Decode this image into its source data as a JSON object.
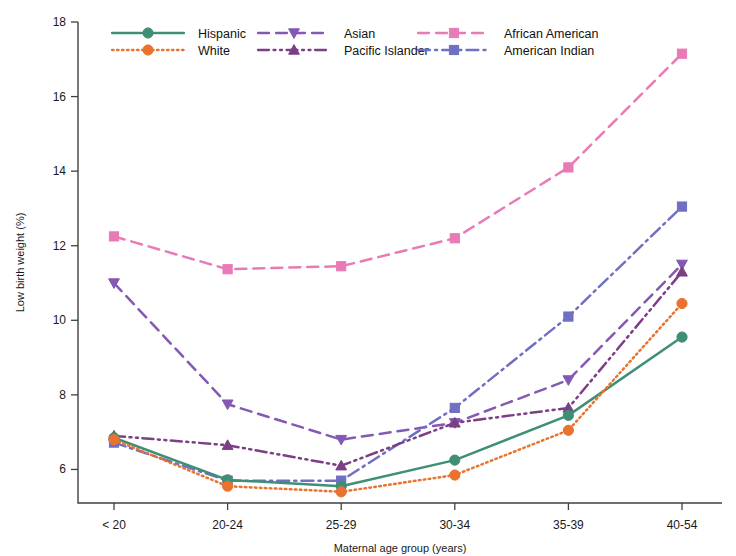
{
  "chart_data": {
    "type": "line",
    "title": "",
    "xlabel": "Maternal age group (years)",
    "ylabel": "Low birth weight (%)",
    "categories": [
      "< 20",
      "20-24",
      "25-29",
      "30-34",
      "35-39",
      "40-54"
    ],
    "ylim": [
      5.1,
      18.0
    ],
    "yticks": [
      6,
      8,
      10,
      12,
      14,
      16,
      18
    ],
    "ytick_labels": [
      "6",
      "8",
      "10",
      "12",
      "14",
      "16",
      "18"
    ],
    "grid": false,
    "legend_position": "top",
    "series": [
      {
        "name": "Hispanic",
        "color": "#3f8f77",
        "marker": "circle",
        "dash": "none",
        "values": [
          6.85,
          5.72,
          5.55,
          6.25,
          7.45,
          9.55
        ]
      },
      {
        "name": "White",
        "color": "#e8722e",
        "marker": "circle",
        "dash": "dotted",
        "values": [
          6.8,
          5.55,
          5.4,
          5.85,
          7.05,
          10.45
        ]
      },
      {
        "name": "Asian",
        "color": "#8359b3",
        "marker": "triangle-down",
        "dash": "dashed",
        "values": [
          11.0,
          7.75,
          6.8,
          7.25,
          8.4,
          11.5
        ]
      },
      {
        "name": "Pacific Islander",
        "color": "#7c3f86",
        "marker": "triangle-up",
        "dash": "dash-dot-dot",
        "values": [
          6.9,
          6.65,
          6.1,
          7.25,
          7.65,
          11.3
        ]
      },
      {
        "name": "African American",
        "color": "#e87ab5",
        "marker": "square",
        "dash": "dashed",
        "values": [
          12.25,
          11.37,
          11.45,
          12.2,
          14.1,
          17.15
        ]
      },
      {
        "name": "American Indian",
        "color": "#6f6fc4",
        "marker": "square",
        "dash": "dash-dot",
        "values": [
          6.72,
          5.7,
          5.7,
          7.65,
          10.1,
          13.05
        ]
      }
    ]
  }
}
